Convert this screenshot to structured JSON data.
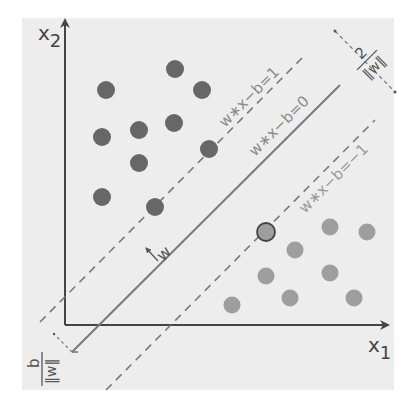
{
  "diagram": {
    "type": "svm-maximum-margin-hyperplane",
    "axes": {
      "x_label": "x",
      "x_subscript": "1",
      "y_label": "x",
      "y_subscript": "2"
    },
    "lines": {
      "upper_margin": "w∗x−b=1",
      "hyperplane": "w∗x−b=0",
      "lower_margin": "w∗x−b=−1"
    },
    "annotations": {
      "normal_vector": "w",
      "margin_numerator": "2",
      "margin_denominator": "‖w‖",
      "offset_numerator": "b",
      "offset_denominator": "‖w‖"
    },
    "colors": {
      "background": "#ededed",
      "class_a": "#676767",
      "class_b": "#9e9e9e",
      "axis": "#444444",
      "line": "#7a7a7a",
      "label": "#8a8a8a"
    },
    "class_a_points": [
      [
        175,
        69
      ],
      [
        106,
        90
      ],
      [
        202,
        90
      ],
      [
        174,
        123
      ],
      [
        139,
        130
      ],
      [
        102,
        137
      ],
      [
        209,
        149
      ],
      [
        139,
        163
      ],
      [
        102,
        197
      ],
      [
        155,
        207
      ]
    ],
    "class_b_points": [
      [
        330,
        227
      ],
      [
        367,
        232
      ],
      [
        295,
        250
      ],
      [
        266,
        276
      ],
      [
        330,
        273
      ],
      [
        290,
        298
      ],
      [
        354,
        298
      ],
      [
        232,
        305
      ]
    ],
    "support_vector_b": [
      266,
      232
    ]
  }
}
